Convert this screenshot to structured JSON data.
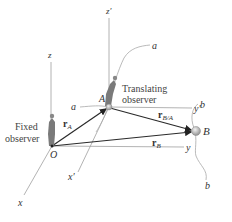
{
  "diagram": {
    "points": {
      "O": {
        "label": "O",
        "x": 52,
        "y": 146
      },
      "A": {
        "label": "A",
        "x": 108,
        "y": 107
      },
      "B": {
        "label": "B",
        "x": 196,
        "y": 131
      }
    },
    "fixed_axes": {
      "x": "x",
      "y": "y",
      "z": "z"
    },
    "translating_axes": {
      "x": "x′",
      "y": "y′",
      "z": "z′"
    },
    "vectors": {
      "rA": {
        "main": "r",
        "sub": "A"
      },
      "rB": {
        "main": "r",
        "sub": "B"
      },
      "rBA": {
        "main": "r",
        "sub": "B/A"
      }
    },
    "paths": {
      "a_top": "a",
      "a_left": "a",
      "b_top": "b",
      "b_bottom": "b"
    },
    "observers": {
      "fixed_line1": "Fixed",
      "fixed_line2": "observer",
      "translating_line1": "Translating",
      "translating_line2": "observer"
    },
    "colors": {
      "axis": "#9a9a9a",
      "vector": "#2a2a2a",
      "particle": "#bdbdbd"
    }
  }
}
